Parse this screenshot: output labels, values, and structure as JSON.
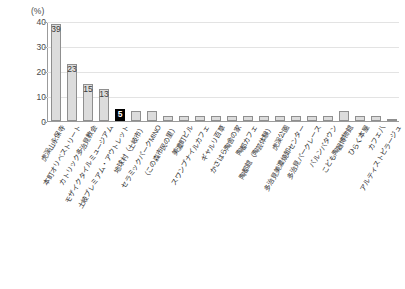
{
  "chart_data": {
    "type": "bar",
    "title": "",
    "subtitle": "",
    "xlabel": "",
    "ylabel": "(%)",
    "unit_label": "(%)",
    "ylim": [
      0,
      40
    ],
    "yticks": [
      0,
      10,
      20,
      30,
      40
    ],
    "ytick_labels": [
      "0",
      "10",
      "20",
      "30",
      "40"
    ],
    "grid": true,
    "legend": "none",
    "highlight_index": 4,
    "highlight_color": "#000000",
    "bar_color": "#dcdcdc",
    "bar_edge_color": "#8f8f8f",
    "categories": [
      "虎渓山永保寺",
      "本町オリベストリート",
      "カトリック多治見教会",
      "モザイクタイルミュージアム",
      "土岐プレミアム・アウトレット",
      "地球村（土岐市）",
      "セラミックパークMINO",
      "（この森市民の里）",
      "美濃町ビル",
      "スワンプナイルカフェ",
      "ギャルリ百草",
      "かさはら陶舎の家",
      "陶都カフェ",
      "陶都館（陶芸体験）",
      "虎渓公園",
      "多治見美濃焼卸センター",
      "多治見パークレース",
      "バルンバタウン",
      "こども陶器博物館",
      "ひらく本屋",
      "カフェ八",
      "アルティストビラージュ"
    ],
    "values": [
      39,
      23,
      15,
      13,
      5,
      4,
      4,
      2,
      2,
      2,
      2,
      2,
      2,
      2,
      2,
      2,
      2,
      2,
      4,
      2,
      2,
      1
    ],
    "value_labels": [
      "39",
      "23",
      "15",
      "13",
      "5",
      "",
      "",
      "",
      "",
      "",
      "",
      "",
      "",
      "",
      "",
      "",
      "",
      "",
      "",
      "",
      "",
      ""
    ]
  }
}
